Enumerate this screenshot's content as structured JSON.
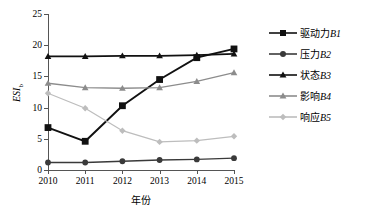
{
  "chart_data": {
    "type": "line",
    "title": "",
    "xlabel": "年份",
    "ylabel": "ESI",
    "ylabel_sub": "b",
    "x": [
      2010,
      2011,
      2012,
      2013,
      2014,
      2015
    ],
    "xticklabels": [
      "2010",
      "2011",
      "2012",
      "2013",
      "2014",
      "2015"
    ],
    "yticklabels": [
      "0",
      "5",
      "10",
      "15",
      "20",
      "25"
    ],
    "yticks": [
      0,
      5,
      10,
      15,
      20,
      25
    ],
    "ylim": [
      0,
      25
    ],
    "grid": false,
    "legend_position": "right",
    "series": [
      {
        "name": "驱动力B1",
        "label_cn": "驱动力",
        "label_code": "B1",
        "marker": "square",
        "color": "#111111",
        "values": [
          6.8,
          4.6,
          10.3,
          14.5,
          18.0,
          19.4
        ]
      },
      {
        "name": "压力B2",
        "label_cn": "压力",
        "label_code": "B2",
        "marker": "circle",
        "color": "#3a3a3a",
        "values": [
          1.2,
          1.2,
          1.4,
          1.6,
          1.7,
          1.9
        ]
      },
      {
        "name": "状态B3",
        "label_cn": "状态",
        "label_code": "B3",
        "marker": "triangle",
        "color": "#111111",
        "values": [
          18.2,
          18.2,
          18.3,
          18.3,
          18.4,
          18.6
        ]
      },
      {
        "name": "影响B4",
        "label_cn": "影响",
        "label_code": "B4",
        "marker": "triangle",
        "color": "#8c8c8c",
        "values": [
          13.9,
          13.2,
          13.1,
          13.2,
          14.2,
          15.6
        ]
      },
      {
        "name": "响应B5",
        "label_cn": "响应",
        "label_code": "B5",
        "marker": "diamond",
        "color": "#bdbdbd",
        "values": [
          12.3,
          9.9,
          6.3,
          4.5,
          4.7,
          5.4
        ]
      }
    ]
  }
}
